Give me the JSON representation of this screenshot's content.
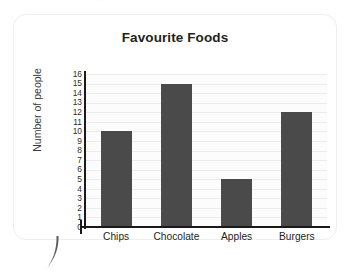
{
  "top_fragment": "·· ···",
  "chart_data": {
    "type": "bar",
    "title": "Favourite Foods",
    "xlabel": "",
    "ylabel": "Number of people",
    "categories": [
      "Chips",
      "Chocolate",
      "Apples",
      "Burgers"
    ],
    "values": [
      10,
      15,
      5,
      12
    ],
    "ylim": [
      0,
      16
    ],
    "ytick_step": 1,
    "yticks": [
      16,
      15,
      14,
      13,
      12,
      11,
      10,
      9,
      8,
      7,
      6,
      5,
      4,
      3,
      2,
      1,
      0
    ],
    "grid": true,
    "legend": null,
    "colors": {
      "bar": "#4a4a4a",
      "axis": "#1a1a1a",
      "gridline": "#ececed",
      "plot_background": "#fcfcfc",
      "text": "#231f20",
      "card_border": "#eeeeee"
    }
  }
}
